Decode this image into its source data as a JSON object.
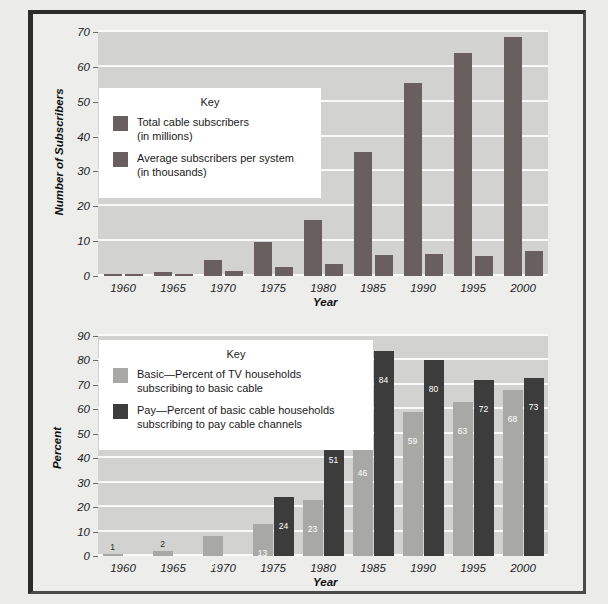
{
  "colors": {
    "bar_dark_top": "#6a5f5f",
    "bar_basic_light": "#a8a8a6",
    "bar_pay_dark": "#3c3c3c",
    "plot_bg": "#d2d2d0",
    "gridline": "#fafafa",
    "key_bg": "#ffffff",
    "page_bg": "#ededec",
    "frame": "#2b2b2b"
  },
  "top_chart": {
    "ylabel": "Number of Subscribers",
    "xlabel": "Year",
    "key_title": "Key",
    "key": [
      {
        "label": "Total cable subscribers\n(in millions)",
        "line1": "Total cable subscribers",
        "line2": "(in millions)",
        "color": "#6a5f5f"
      },
      {
        "label": "Average subscribers per system\n(in thousands)",
        "line1": "Average subscribers per system",
        "line2": "(in thousands)",
        "color": "#6a5f5f"
      }
    ],
    "yticks": [
      "0",
      "10",
      "20",
      "30",
      "40",
      "50",
      "60",
      "70"
    ],
    "xticks": [
      "1960",
      "1965",
      "1970",
      "1975",
      "1980",
      "1985",
      "1990",
      "1995",
      "2000"
    ]
  },
  "bottom_chart": {
    "ylabel": "Percent",
    "xlabel": "Year",
    "key_title": "Key",
    "key": [
      {
        "line1": "Basic—Percent of TV households",
        "line2": "subscribing to basic cable",
        "color": "#a8a8a6"
      },
      {
        "line1": "Pay—Percent of basic cable households",
        "line2": "subscribing to pay cable channels",
        "color": "#3c3c3c"
      }
    ],
    "yticks": [
      "0",
      "10",
      "20",
      "30",
      "40",
      "50",
      "60",
      "70",
      "80",
      "90"
    ],
    "xticks": [
      "1960",
      "1965",
      "1970",
      "1975",
      "1980",
      "1985",
      "1990",
      "1995",
      "2000"
    ]
  },
  "chart_data": [
    {
      "type": "bar",
      "title": "",
      "xlabel": "Year",
      "ylabel": "Number of Subscribers",
      "ylim": [
        0,
        70
      ],
      "yticks": [
        0,
        10,
        20,
        30,
        40,
        50,
        60,
        70
      ],
      "grid": true,
      "legend_position": "inside-upper-left",
      "categories": [
        "1960",
        "1965",
        "1970",
        "1975",
        "1980",
        "1985",
        "1990",
        "1995",
        "2000"
      ],
      "series": [
        {
          "name": "Total cable subscribers (in millions)",
          "color": "#6a5f5f",
          "values": [
            0.6,
            1.2,
            4.5,
            9.8,
            16.0,
            35.5,
            55.5,
            64.0,
            68.5
          ]
        },
        {
          "name": "Average subscribers per system (in thousands)",
          "color": "#6a5f5f",
          "values": [
            0.7,
            0.3,
            1.3,
            2.5,
            3.5,
            6.0,
            6.2,
            5.8,
            7.2
          ]
        }
      ]
    },
    {
      "type": "bar",
      "title": "",
      "xlabel": "Year",
      "ylabel": "Percent",
      "ylim": [
        0,
        90
      ],
      "yticks": [
        0,
        10,
        20,
        30,
        40,
        50,
        60,
        70,
        80,
        90
      ],
      "grid": true,
      "legend_position": "inside-upper-left",
      "categories": [
        "1960",
        "1965",
        "1970",
        "1975",
        "1980",
        "1985",
        "1990",
        "1995",
        "2000"
      ],
      "series": [
        {
          "name": "Basic—Percent of TV households subscribing to basic cable",
          "color": "#a8a8a6",
          "values": [
            1,
            2,
            8,
            13,
            23,
            46,
            59,
            63,
            68
          ],
          "labels": [
            "1",
            "2",
            "8",
            "13",
            "23",
            "46",
            "59",
            "63",
            "68"
          ]
        },
        {
          "name": "Pay—Percent of basic cable households subscribing to pay cable channels",
          "color": "#3c3c3c",
          "values": [
            null,
            null,
            null,
            24,
            51,
            84,
            80,
            72,
            73
          ],
          "labels": [
            "",
            "",
            "",
            "24",
            "51",
            "84",
            "80",
            "72",
            "73"
          ]
        }
      ]
    }
  ]
}
